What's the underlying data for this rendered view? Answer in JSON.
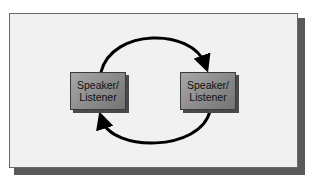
{
  "diagram": {
    "nodes": [
      {
        "line1": "Speaker/",
        "line2": "Listener"
      },
      {
        "line1": "Speaker/",
        "line2": "Listener"
      }
    ],
    "edges": [
      {
        "from": 0,
        "to": 1,
        "label": ""
      },
      {
        "from": 1,
        "to": 0,
        "label": ""
      }
    ],
    "colors": {
      "panel": "#f1f1f1",
      "node_fill": "#8a8a8a",
      "arrow": "#000000",
      "shadow": "#5a5a5a"
    }
  }
}
